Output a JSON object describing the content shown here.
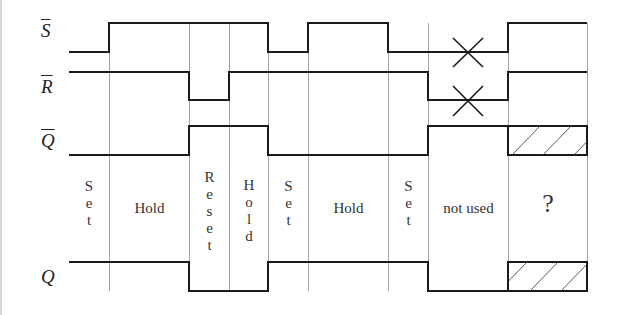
{
  "diagram": {
    "signals": [
      {
        "id": "S_bar",
        "label": "S",
        "overline": true
      },
      {
        "id": "R_bar",
        "label": "R",
        "overline": true
      },
      {
        "id": "Q_bar",
        "label": "Q",
        "overline": true
      },
      {
        "id": "Q",
        "label": "Q",
        "overline": false
      }
    ],
    "phases": [
      {
        "label": "Set",
        "vertical": true
      },
      {
        "label": "Hold",
        "vertical": false
      },
      {
        "label": "Reset",
        "vertical": true
      },
      {
        "label": "Hold",
        "vertical": true
      },
      {
        "label": "Set",
        "vertical": true
      },
      {
        "label": "Hold",
        "vertical": false
      },
      {
        "label": "Set",
        "vertical": true
      },
      {
        "label": "not used",
        "vertical": false
      },
      {
        "label": "?",
        "vertical": false
      }
    ],
    "phase_text": {
      "p0": "S\ne\nt",
      "p1": "Hold",
      "p2": "R\ne\ns\ne\nt",
      "p3": "H\no\nl\nd",
      "p4": "S\ne\nt",
      "p5": "Hold",
      "p6": "S\ne\nt",
      "p7": "not used",
      "p8": "?"
    },
    "waveforms": {
      "S_bar": [
        0,
        1,
        1,
        1,
        0,
        1,
        0,
        "X",
        1
      ],
      "R_bar": [
        1,
        1,
        0,
        1,
        1,
        1,
        1,
        "X",
        1
      ],
      "Q_bar": [
        0,
        0,
        1,
        1,
        0,
        0,
        0,
        1,
        "undefined"
      ],
      "Q": [
        1,
        1,
        0,
        0,
        1,
        1,
        1,
        0,
        "undefined"
      ]
    },
    "boundaries_x": [
      69,
      109,
      189,
      229,
      268,
      308,
      388,
      428,
      508,
      587
    ]
  }
}
